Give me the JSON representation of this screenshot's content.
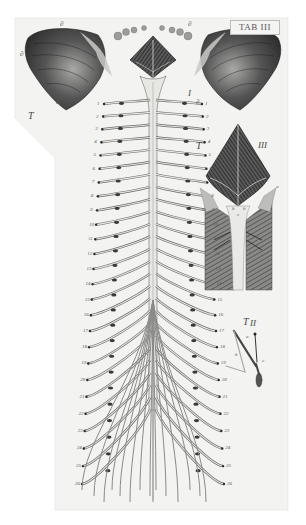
{
  "plate": {
    "title": "TAB III",
    "paper_color": "#f3f3f1",
    "ink_color": "#2a2a2a",
    "background_color": "#ffffff"
  },
  "figures": {
    "fig1": {
      "label": "I",
      "tab_marker": "T",
      "description": "cerebellum, medulla and spinal cord with nerve roots"
    },
    "fig2": {
      "label": "II",
      "tab_marker": "T",
      "description": "small detail of nerve root ganglion"
    },
    "fig3": {
      "label": "III",
      "tab_marker": "T",
      "description": "fourth ventricle and medulla in surrounding tissue"
    }
  },
  "labels": {
    "cerebellum_left": [
      "∂",
      "∂",
      "∂"
    ],
    "cerebellum_right": [
      "∂",
      "∂",
      "∂"
    ],
    "left_nerve_numbers": [
      "1",
      "2",
      "3",
      "4",
      "5",
      "6",
      "7",
      "8",
      "9",
      "10",
      "11",
      "12",
      "13",
      "14",
      "15",
      "16",
      "17",
      "18",
      "19",
      "20",
      "21",
      "22",
      "23",
      "24",
      "25",
      "26",
      "27",
      "28",
      "29",
      "30"
    ],
    "right_nerve_numbers": [
      "1",
      "2",
      "3",
      "4",
      "5",
      "6",
      "7",
      "8",
      "9",
      "10",
      "11",
      "12",
      "13",
      "14",
      "15",
      "16",
      "17",
      "18",
      "19",
      "20",
      "21",
      "22",
      "23",
      "24",
      "25",
      "26",
      "27",
      "28",
      "29",
      "30"
    ],
    "fig3_letters": [
      "a",
      "b",
      "c",
      "b",
      "a"
    ],
    "fig2_letters": [
      "a",
      "b",
      "c"
    ],
    "cauda_labels": [
      "a",
      "b",
      "c",
      "d",
      "e"
    ]
  }
}
